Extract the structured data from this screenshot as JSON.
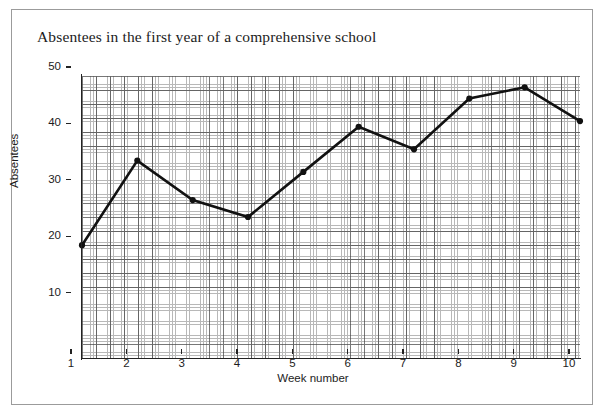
{
  "page": {
    "background_color": "#ffffff",
    "frame_color": "#9b9b9b"
  },
  "title": "Absentees in the first year of a comprehensive school",
  "axes": {
    "y_label": "Absentees",
    "x_label": "Week number",
    "y_ticks": [
      "10",
      "20",
      "30",
      "40",
      "50"
    ],
    "x_ticks": [
      "1",
      "2",
      "3",
      "4",
      "5",
      "6",
      "7",
      "8",
      "9",
      "10"
    ]
  },
  "chart_data": {
    "type": "line",
    "title": "Absentees in the first year of a comprehensive school",
    "xlabel": "Week number",
    "ylabel": "Absentees",
    "categories": [
      1,
      2,
      3,
      4,
      5,
      6,
      7,
      8,
      9,
      10
    ],
    "x": [
      1,
      2,
      3,
      4,
      5,
      6,
      7,
      8,
      9,
      10
    ],
    "values": [
      20,
      35,
      28,
      25,
      33,
      41,
      37,
      46,
      48,
      42
    ],
    "series": [
      {
        "name": "Absentees",
        "values": [
          20,
          35,
          28,
          25,
          33,
          41,
          37,
          46,
          48,
          42
        ],
        "color": "#111111",
        "marker": "filled-circle"
      }
    ],
    "xlim": [
      1,
      10
    ],
    "ylim": [
      0,
      50
    ],
    "y_tick_interval": 10,
    "x_tick_interval": 1,
    "grid": true,
    "grid_minor": true,
    "grid_minor_interval": 2,
    "legend": "none",
    "line_color": "#111111"
  }
}
